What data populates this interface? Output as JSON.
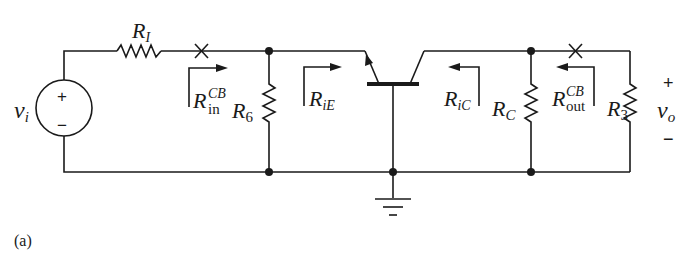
{
  "figure": {
    "caption": "(a)",
    "type": "common-base amplifier small-signal circuit"
  },
  "source": {
    "name": "v",
    "subscript": "i",
    "plus": "+",
    "minus": "−"
  },
  "components": {
    "RI": {
      "name": "R",
      "subscript": "I"
    },
    "R6": {
      "name": "R",
      "subscript": "6"
    },
    "RC": {
      "name": "R",
      "subscript": "C"
    },
    "R3": {
      "name": "R",
      "subscript": "3"
    }
  },
  "resistance_labels": {
    "Rin": {
      "name": "R",
      "superscript": "CB",
      "subscript": "in"
    },
    "RiE": {
      "name": "R",
      "subscript": "iE"
    },
    "RiC": {
      "name": "R",
      "subscript": "iC"
    },
    "Rout": {
      "name": "R",
      "superscript": "CB",
      "subscript": "out"
    }
  },
  "output": {
    "name": "v",
    "subscript": "o",
    "plus": "+",
    "minus": "−"
  }
}
